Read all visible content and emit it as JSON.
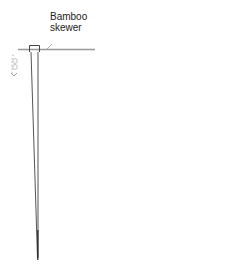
{
  "diagram": {
    "label_line1": "Bamboo",
    "label_line2": "skewer",
    "colors": {
      "stroke": "#555555",
      "skewer": "#999999",
      "rotation_mark": "#bbbbbb",
      "text": "#222222"
    }
  }
}
